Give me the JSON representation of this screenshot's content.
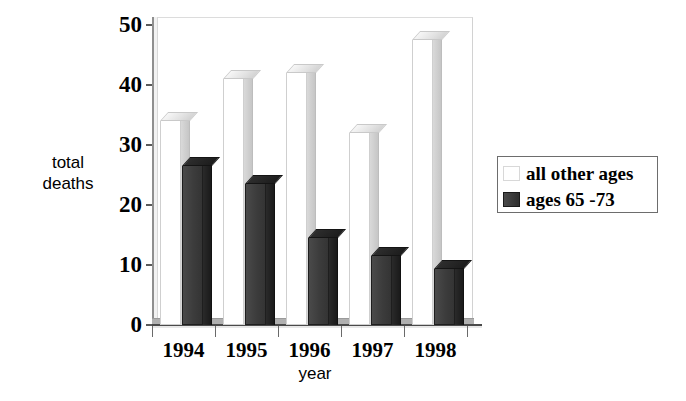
{
  "chart_data": {
    "type": "bar",
    "title": "",
    "xlabel": "year",
    "ylabel": "total\ndeaths",
    "categories": [
      "1994",
      "1995",
      "1996",
      "1997",
      "1998"
    ],
    "series": [
      {
        "name": "all other ages",
        "values": [
          34,
          41,
          42,
          32,
          47.5
        ],
        "color": "#ffffff"
      },
      {
        "name": "ages 65 -73",
        "values": [
          26.5,
          23.5,
          14.5,
          11.5,
          9.3
        ],
        "color": "#3c3c3c"
      }
    ],
    "ylim": [
      0,
      50
    ],
    "yticks": [
      0,
      10,
      20,
      30,
      40,
      50
    ],
    "ytick_labels": [
      "0",
      "10",
      "20",
      "30",
      "40",
      "50"
    ],
    "grid": false,
    "legend_position": "right-outside",
    "style": "3d-column"
  },
  "axes": {
    "y_title": "total\ndeaths",
    "x_title": "year"
  },
  "legend": {
    "entries": [
      {
        "label": "all other ages",
        "swatch": "white-swatch"
      },
      {
        "label": "ages 65 -73",
        "swatch": "dark-swatch"
      }
    ]
  }
}
